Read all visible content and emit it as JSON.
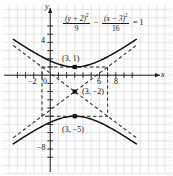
{
  "figure": {
    "kind": "hyperbola-graph",
    "background": "#fdfdfc",
    "grid_color": "#c9c9d6",
    "axis_color": "#1a1a1a",
    "curve_color": "#111111",
    "dash_color": "#333333"
  },
  "equation": {
    "numerator_left": "(y + 2)",
    "numerator_left_exp": "2",
    "denominator_left": "9",
    "operator": "−",
    "numerator_right": "(x − 3)",
    "numerator_right_exp": "2",
    "denominator_right": "16",
    "equals": "= 1"
  },
  "axes": {
    "x_label": "x",
    "y_label": "y",
    "x_ticklabels": [
      "−2",
      "0",
      "6",
      "8"
    ],
    "y_ticklabels": [
      "4",
      "−8"
    ]
  },
  "annotations": {
    "vertex_top": "(3, 1)",
    "center": "(3, −2)",
    "vertex_bottom": "(3, −5)"
  },
  "chart_data": {
    "type": "line",
    "title": "",
    "xlabel": "x",
    "ylabel": "y",
    "xlim": [
      -4.5,
      10.5
    ],
    "ylim": [
      -10.5,
      6.5
    ],
    "grid": true,
    "legend": null,
    "equation_latex": "(y+2)^2/9 - (x-3)^2/16 = 1",
    "conic": {
      "kind": "hyperbola",
      "orientation": "vertical",
      "center": [
        3,
        -2
      ],
      "a": 3,
      "b": 4,
      "vertices": [
        [
          3,
          1
        ],
        [
          3,
          -5
        ]
      ],
      "asymptote_slopes": [
        0.75,
        -0.75
      ],
      "asymptote_box": {
        "x": [
          -1,
          7
        ],
        "y": [
          -5,
          1
        ]
      }
    },
    "xticks": [
      -4,
      -3,
      -2,
      -1,
      0,
      1,
      2,
      3,
      4,
      5,
      6,
      7,
      8,
      9,
      10
    ],
    "yticks": [
      -10,
      -9,
      -8,
      -7,
      -6,
      -5,
      -4,
      -3,
      -2,
      -1,
      0,
      1,
      2,
      3,
      4,
      5,
      6
    ],
    "labeled_xticks": [
      -2,
      0,
      6,
      8
    ],
    "labeled_yticks": [
      4,
      -8
    ],
    "series": [
      {
        "name": "upper branch",
        "x": [
          -4.5,
          -3.5,
          -2.5,
          -1.5,
          -0.5,
          0.5,
          1.5,
          2.5,
          3,
          3.5,
          4.5,
          5.5,
          6.5,
          7.5,
          8.5,
          9.5,
          10.5
        ],
        "y": [
          4.02,
          3.18,
          2.41,
          1.75,
          1.23,
          0.9,
          0.77,
          0.9,
          1.0,
          0.9,
          0.77,
          0.9,
          1.23,
          1.75,
          2.41,
          3.18,
          4.02
        ]
      },
      {
        "name": "lower branch",
        "x": [
          -4.5,
          -3.5,
          -2.5,
          -1.5,
          -0.5,
          0.5,
          1.5,
          2.5,
          3,
          3.5,
          4.5,
          5.5,
          6.5,
          7.5,
          8.5,
          9.5,
          10.5
        ],
        "y": [
          -8.02,
          -7.18,
          -6.41,
          -5.75,
          -5.23,
          -4.9,
          -4.77,
          -4.9,
          -5.0,
          -4.9,
          -4.77,
          -4.9,
          -5.23,
          -5.75,
          -6.41,
          -7.18,
          -8.02
        ]
      },
      {
        "name": "asymptote positive slope",
        "x": [
          -4.5,
          10.5
        ],
        "y": [
          -7.625,
          3.625
        ]
      },
      {
        "name": "asymptote negative slope",
        "x": [
          -4.5,
          10.5
        ],
        "y": [
          3.625,
          -7.625
        ]
      }
    ],
    "points": [
      {
        "label": "(3, 1)",
        "x": 3,
        "y": 1
      },
      {
        "label": "(3, −2)",
        "x": 3,
        "y": -2
      },
      {
        "label": "(3, −5)",
        "x": 3,
        "y": -5
      }
    ]
  }
}
